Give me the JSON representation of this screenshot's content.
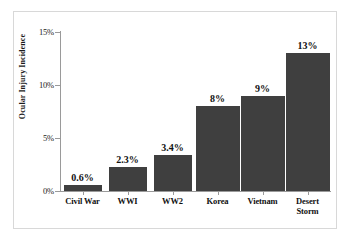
{
  "chart_data": {
    "type": "bar",
    "title": "",
    "subtitle": "",
    "xlabel": "",
    "ylabel": "Ocular Injury Incidence",
    "categories": [
      "Civil War",
      "WWI",
      "WW2",
      "Korea",
      "Vietnam",
      "Desert Storm"
    ],
    "values": [
      0.6,
      2.3,
      3.4,
      8,
      9,
      13
    ],
    "value_labels": [
      "0.6%",
      "2.3%",
      "3.4%",
      "8%",
      "9%",
      "13%"
    ],
    "ylim": [
      0,
      15
    ],
    "ytick_values": [
      0,
      5,
      10,
      15
    ],
    "ytick_labels": [
      "0%",
      "5%",
      "10%",
      "15%"
    ],
    "grid": false,
    "legend": false,
    "legend_position": "none",
    "bar_color": "#3f3f3f",
    "axis_color": "#9a9a9a",
    "text_color": "#111111",
    "background_color": "#ffffff",
    "frame_color": "#d8d8d8"
  },
  "axis": {
    "y_title": "Ocular Injury Incidence"
  },
  "categories": [
    {
      "label_line1": "Civil War",
      "label_line2": ""
    },
    {
      "label_line1": "WWI",
      "label_line2": ""
    },
    {
      "label_line1": "WW2",
      "label_line2": ""
    },
    {
      "label_line1": "Korea",
      "label_line2": ""
    },
    {
      "label_line1": "Vietnam",
      "label_line2": ""
    },
    {
      "label_line1": "Desert",
      "label_line2": "Storm"
    }
  ]
}
